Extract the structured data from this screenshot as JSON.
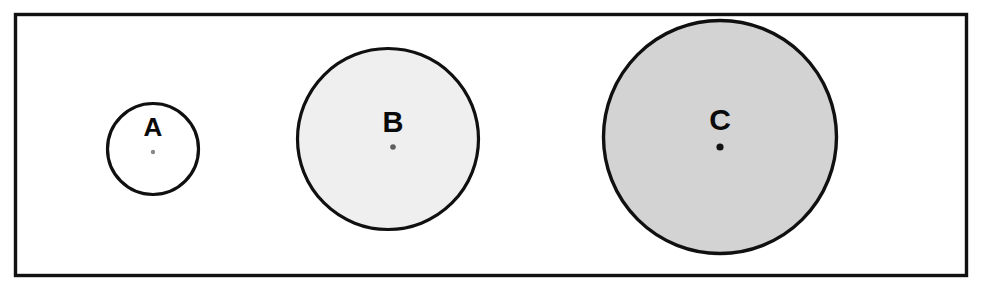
{
  "figure": {
    "title": "",
    "background_color": "#ffffff",
    "width": 997,
    "height": 298,
    "frame": {
      "name": "outer-boundary-rectangle",
      "x": 15.5,
      "y": 14.5,
      "width": 951,
      "height": 261,
      "stroke_color": "#111111",
      "stroke_width": 3.4,
      "fill": "none"
    }
  },
  "circles": [
    {
      "id": "a",
      "label": "A",
      "cx": 153,
      "cy": 149,
      "r": 45.5,
      "diameter": 91,
      "fill_color": "#ffffff",
      "stroke_color": "#101010",
      "stroke_width": 3.2,
      "label_x": 153,
      "label_y": 129,
      "label_font_size": 26,
      "center_dot": {
        "cx": 153,
        "cy": 152,
        "r": 2.2,
        "color": "#8a8a8a"
      }
    },
    {
      "id": "b",
      "label": "B",
      "cx": 388,
      "cy": 139,
      "r": 90.5,
      "diameter": 181,
      "fill_color": "#efefef",
      "stroke_color": "#101010",
      "stroke_width": 3.2,
      "label_x": 393,
      "label_y": 124,
      "label_font_size": 29,
      "center_dot": {
        "cx": 393,
        "cy": 147,
        "r": 2.8,
        "color": "#5e5e5e"
      }
    },
    {
      "id": "c",
      "label": "C",
      "cx": 720,
      "cy": 137,
      "r": 116.5,
      "diameter": 233,
      "fill_color": "#d3d3d3",
      "stroke_color": "#101010",
      "stroke_width": 3.4,
      "label_x": 720,
      "label_y": 122,
      "label_font_size": 30,
      "center_dot": {
        "cx": 720,
        "cy": 147,
        "r": 3.6,
        "color": "#121212"
      }
    }
  ]
}
